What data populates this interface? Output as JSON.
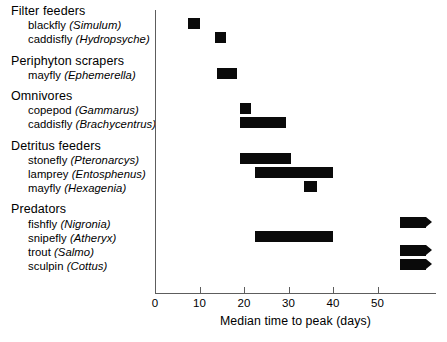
{
  "chart_data": {
    "type": "bar",
    "orientation": "horizontal",
    "title": "",
    "xlabel": "Median time to peak (days)",
    "ylabel": "",
    "xlim": [
      0,
      63
    ],
    "xticks": [
      0,
      10,
      20,
      30,
      40,
      50
    ],
    "xtick_labels": [
      "0",
      "10",
      "20",
      "30",
      "40",
      "50"
    ],
    "grid": false,
    "legend": false,
    "note": "Horizontal range bars; bars ending in an arrowhead extend beyond the plotted axis range.",
    "groups": [
      {
        "label": "Filter feeders",
        "items": [
          {
            "common": "blackfly",
            "scientific": "(Simulum)",
            "start": 7.5,
            "end": 10.0,
            "open_right": false
          },
          {
            "common": "caddisfly",
            "scientific": "(Hydropsyche)",
            "start": 13.5,
            "end": 16.0,
            "open_right": false
          }
        ]
      },
      {
        "label": "Periphyton scrapers",
        "items": [
          {
            "common": "mayfly",
            "scientific": "(Ephemerella)",
            "start": 14.0,
            "end": 18.5,
            "open_right": false
          }
        ]
      },
      {
        "label": "Omnivores",
        "items": [
          {
            "common": "copepod",
            "scientific": "(Gammarus)",
            "start": 19.0,
            "end": 21.5,
            "open_right": false
          },
          {
            "common": "caddisfly",
            "scientific": "(Brachycentrus)",
            "start": 19.0,
            "end": 29.5,
            "open_right": false
          }
        ]
      },
      {
        "label": "Detritus feeders",
        "items": [
          {
            "common": "stonefly",
            "scientific": "(Pteronarcys)",
            "start": 19.0,
            "end": 30.5,
            "open_right": false
          },
          {
            "common": "lamprey",
            "scientific": "(Entosphenus)",
            "start": 22.5,
            "end": 40.0,
            "open_right": false
          },
          {
            "common": "mayfly",
            "scientific": "(Hexagenia)",
            "start": 33.5,
            "end": 36.5,
            "open_right": false
          }
        ]
      },
      {
        "label": "Predators",
        "items": [
          {
            "common": "fishfly",
            "scientific": "(Nigronia)",
            "start": 55.0,
            "end": 61.0,
            "open_right": true
          },
          {
            "common": "snipefly",
            "scientific": "(Atheryx)",
            "start": 22.5,
            "end": 40.0,
            "open_right": false
          },
          {
            "common": "trout",
            "scientific": "(Salmo)",
            "start": 55.0,
            "end": 61.0,
            "open_right": true
          },
          {
            "common": "sculpin",
            "scientific": "(Cottus)",
            "start": 55.0,
            "end": 61.0,
            "open_right": true
          }
        ]
      }
    ]
  },
  "colors": {
    "bar": "#0a0a0a",
    "axis": "#5d5d5d",
    "text": "#000000",
    "background": "#ffffff"
  }
}
